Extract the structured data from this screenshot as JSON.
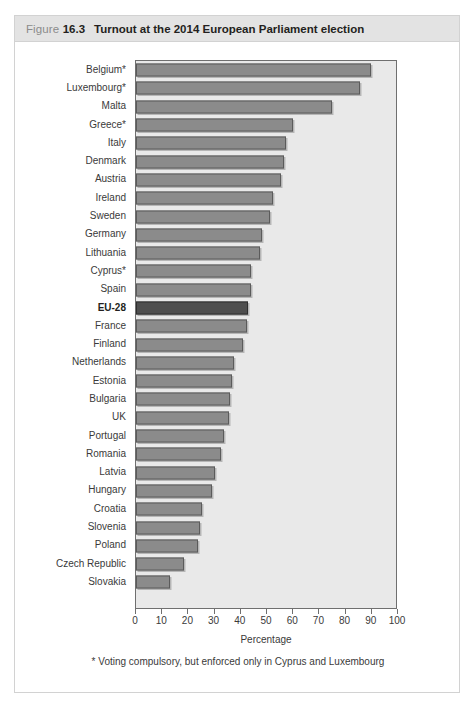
{
  "figure": {
    "label": "Figure",
    "number": "16.3",
    "title": "Turnout at the 2014 European Parliament election"
  },
  "footnote": "* Voting compulsory, but enforced only in Cyprus and Luxembourg",
  "colors": {
    "bar": "#8b8b8b",
    "bar_border": "#5b5b5b",
    "highlight_bar": "#4e4e4e",
    "plot_background": "#e9e9e9",
    "header_band": "#e3e3e3",
    "text": "#3a3a3a"
  },
  "chart_data": {
    "type": "bar",
    "orientation": "horizontal",
    "title": "Turnout at the 2014 European Parliament election",
    "xlabel": "Percentage",
    "ylabel": "",
    "xlim": [
      0,
      100
    ],
    "xticks": [
      0,
      10,
      20,
      30,
      40,
      50,
      60,
      70,
      80,
      90,
      100
    ],
    "grid": false,
    "legend": null,
    "highlight_category": "EU-28",
    "note": "* Voting compulsory, but enforced only in Cyprus and Luxembourg",
    "categories": [
      "Belgium*",
      "Luxembourg*",
      "Malta",
      "Greece*",
      "Italy",
      "Denmark",
      "Austria",
      "Ireland",
      "Sweden",
      "Germany",
      "Lithuania",
      "Cyprus*",
      "Spain",
      "EU-28",
      "France",
      "Finland",
      "Netherlands",
      "Estonia",
      "Bulgaria",
      "UK",
      "Portugal",
      "Romania",
      "Latvia",
      "Hungary",
      "Croatia",
      "Slovenia",
      "Poland",
      "Czech Republic",
      "Slovakia"
    ],
    "values": [
      89.6,
      85.6,
      74.8,
      60.0,
      57.2,
      56.3,
      55.3,
      52.4,
      51.1,
      48.1,
      47.3,
      44.0,
      43.8,
      42.6,
      42.4,
      41.0,
      37.3,
      36.5,
      35.8,
      35.6,
      33.7,
      32.4,
      30.2,
      28.9,
      25.2,
      24.5,
      23.8,
      18.2,
      13.1
    ],
    "units": "percent"
  }
}
